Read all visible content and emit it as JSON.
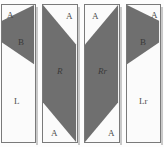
{
  "figure": {
    "panel_count": 4,
    "background_color": "#fdfdfd",
    "fill_color": "#6f6f6f",
    "panel_face_color": "#fbfbfb",
    "border_color": "#7a7a7a",
    "label_color": "#4c4c4c"
  },
  "panels": [
    {
      "id": "panel-1",
      "name": "L",
      "labels": {
        "corner": "A",
        "shape": "B",
        "body": "L"
      },
      "shape_type": "triangle",
      "orientation": "left-pointing"
    },
    {
      "id": "panel-2",
      "name": "R",
      "labels": {
        "corner_top": "A",
        "corner_bottom": "A",
        "shape": "R"
      },
      "shape_type": "parallelogram",
      "orientation": "top-left-to-bottom-right"
    },
    {
      "id": "panel-3",
      "name": "Rr",
      "labels": {
        "corner_top": "A",
        "corner_bottom": "A",
        "shape": "Rr"
      },
      "shape_type": "parallelogram",
      "orientation": "top-right-to-bottom-left"
    },
    {
      "id": "panel-4",
      "name": "Lr",
      "labels": {
        "corner": "A",
        "shape": "B",
        "body": "Lr"
      },
      "shape_type": "triangle",
      "orientation": "right-pointing"
    }
  ]
}
